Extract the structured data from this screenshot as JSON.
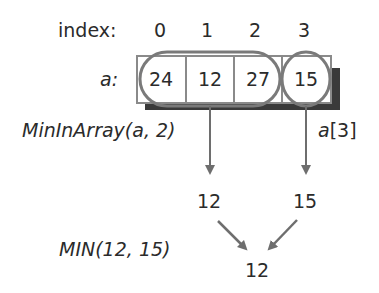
{
  "index_row": {
    "label": "index:",
    "indices": [
      "0",
      "1",
      "2",
      "3"
    ]
  },
  "array": {
    "label": "a:",
    "values": [
      "24",
      "12",
      "27",
      "15"
    ]
  },
  "recursive_call": {
    "label": "MinInArray(a, 2)",
    "result": "12"
  },
  "last_element": {
    "label_prefix": "a",
    "label_suffix": "[3]",
    "value": "15"
  },
  "min_call": {
    "label": "MIN(12, 15)",
    "result": "12"
  },
  "colors": {
    "outline": "#7a7a7a",
    "shadow": "#3a3a3a",
    "arrow": "#6e6e6e",
    "text": "#2b2b2b"
  }
}
